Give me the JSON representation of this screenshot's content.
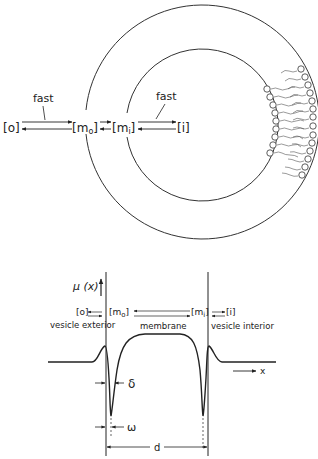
{
  "top_diagram": {
    "species": {
      "outer": "[o]",
      "membrane_outer": "[m",
      "membrane_outer_sub": "o",
      "membrane_inner": "[m",
      "membrane_inner_sub": "i",
      "inner": "[i]"
    },
    "bracket_close": "]",
    "rate_labels": {
      "left": "fast",
      "right": "fast"
    }
  },
  "profile_diagram": {
    "y_axis_label": "μ (x)",
    "x_axis_label": "x",
    "regions": {
      "exterior": "vesicle exterior",
      "membrane": "membrane",
      "interior": "vesicle interior"
    },
    "species": {
      "outer": "[o]",
      "m_o": "[m",
      "m_o_sub": "o",
      "m_i": "[m",
      "m_i_sub": "i",
      "inner": "[i]"
    },
    "dimensions": {
      "delta": "δ",
      "omega": "ω",
      "d": "d"
    }
  },
  "colors": {
    "ink": "#222222",
    "background": "#ffffff"
  }
}
